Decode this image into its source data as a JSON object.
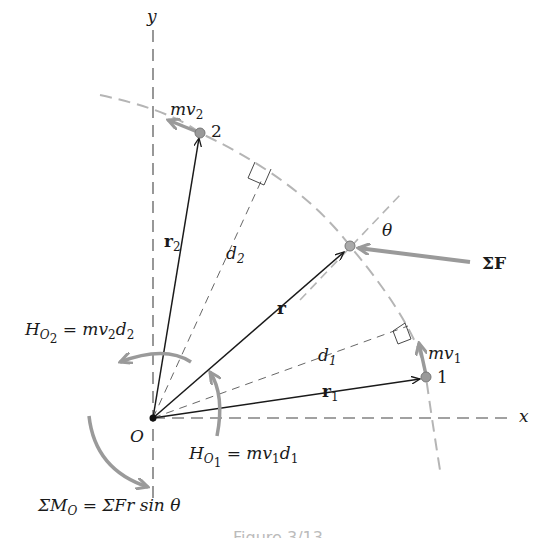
{
  "diagram": {
    "axes": {
      "x_label": "x",
      "y_label": "y",
      "origin_label": "O"
    },
    "points": [
      {
        "id": "2",
        "label": "2",
        "momentum_label": "mv",
        "momentum_sub": "2"
      },
      {
        "id": "r",
        "angle_label": "θ"
      },
      {
        "id": "1",
        "label": "1",
        "momentum_label": "mv",
        "momentum_sub": "1"
      }
    ],
    "vectors": {
      "r2": {
        "label": "r",
        "sub": "2"
      },
      "r": {
        "label": "r"
      },
      "r1": {
        "label": "r",
        "sub": "1"
      }
    },
    "distances": {
      "d2": {
        "label": "d",
        "sub": "2"
      },
      "d1": {
        "label": "d",
        "sub": "1"
      }
    },
    "force": {
      "label": "ΣF"
    },
    "equations": {
      "H_O2": {
        "lhs": "H",
        "sub1": "O",
        "sub2": "2",
        "rhs": " = mv",
        "rhs_sub1": "2",
        "rhs_d": "d",
        "rhs_sub2": "2"
      },
      "H_O1": {
        "lhs": "H",
        "sub1": "O",
        "sub2": "1",
        "rhs": " = mv",
        "rhs_sub1": "1",
        "rhs_d": "d",
        "rhs_sub2": "1"
      },
      "moment": {
        "lhs": "ΣM",
        "sub": "O",
        "rhs": " = ΣFr sin θ"
      }
    },
    "colors": {
      "ink": "#1a1a1a",
      "gray": "#9a9a9a",
      "path": "#b5b5b5"
    },
    "caption": "Figure 3/13"
  }
}
